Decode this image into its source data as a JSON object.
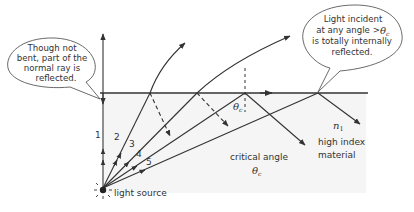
{
  "diagram": {
    "callouts": [
      {
        "id": "normal-ray-note",
        "lines": [
          "Though not",
          "bent, part of the",
          "normal ray is",
          "reflected."
        ]
      },
      {
        "id": "tir-note",
        "lines": [
          "Light incident",
          "at any angle >",
          "is totally internally",
          "reflected."
        ],
        "symbol": "θ",
        "symbol_sub": "c"
      }
    ],
    "rays": [
      {
        "label": "1"
      },
      {
        "label": "2"
      },
      {
        "label": "3"
      },
      {
        "label": "4"
      },
      {
        "label": "5"
      }
    ],
    "light_source_label": "light source",
    "critical_angle": {
      "label": "critical angle",
      "symbol": "θ",
      "sub": "c"
    },
    "angle_marker": {
      "symbol": "θ",
      "sub": "c"
    },
    "material": {
      "index_symbol": "n",
      "index_sub": "1",
      "lines": [
        "high index",
        "material"
      ]
    },
    "colors": {
      "line": "#333333",
      "medium_fill": "#f4f4f4"
    }
  }
}
